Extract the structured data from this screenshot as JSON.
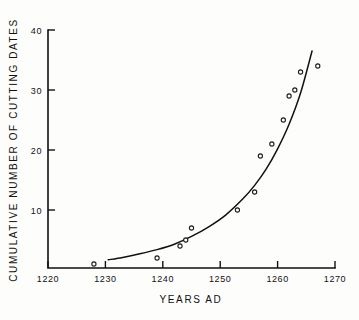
{
  "chart_data": {
    "type": "scatter",
    "title": "",
    "xlabel": "YEARS AD",
    "ylabel": "CUMULATIVE NUMBER OF CUTTING DATES",
    "xlim": [
      1220,
      1270
    ],
    "ylim": [
      0,
      41
    ],
    "xticks": [
      1220,
      1230,
      1240,
      1250,
      1260,
      1270
    ],
    "xtick_labels": [
      "1220",
      "1230",
      "1240",
      "1250",
      "1260",
      "1270"
    ],
    "yticks": [
      10,
      20,
      30,
      40
    ],
    "ytick_labels": [
      "10",
      "20",
      "30",
      "40"
    ],
    "grid": false,
    "legend": "none",
    "marker": "open-circle",
    "points": [
      {
        "x": 1228,
        "y": 1
      },
      {
        "x": 1239,
        "y": 2
      },
      {
        "x": 1243,
        "y": 4
      },
      {
        "x": 1244,
        "y": 5
      },
      {
        "x": 1245,
        "y": 7
      },
      {
        "x": 1253,
        "y": 10
      },
      {
        "x": 1256,
        "y": 13
      },
      {
        "x": 1257,
        "y": 19
      },
      {
        "x": 1259,
        "y": 21
      },
      {
        "x": 1261,
        "y": 25
      },
      {
        "x": 1262,
        "y": 29
      },
      {
        "x": 1263,
        "y": 30
      },
      {
        "x": 1264,
        "y": 33
      },
      {
        "x": 1267,
        "y": 34
      }
    ],
    "fit_curve": {
      "name": "fitted exponential growth curve",
      "x_start": 1230.5,
      "x_end": 1266,
      "y_start": 1.7,
      "y_end": 36.5,
      "samples": [
        {
          "x": 1230.5,
          "y": 1.7
        },
        {
          "x": 1233,
          "y": 2.1
        },
        {
          "x": 1236,
          "y": 2.7
        },
        {
          "x": 1239,
          "y": 3.4
        },
        {
          "x": 1242,
          "y": 4.3
        },
        {
          "x": 1245,
          "y": 5.6
        },
        {
          "x": 1248,
          "y": 7.2
        },
        {
          "x": 1251,
          "y": 9.2
        },
        {
          "x": 1254,
          "y": 11.9
        },
        {
          "x": 1256,
          "y": 14.1
        },
        {
          "x": 1258,
          "y": 16.8
        },
        {
          "x": 1260,
          "y": 20.2
        },
        {
          "x": 1262,
          "y": 24.3
        },
        {
          "x": 1264,
          "y": 29.5
        },
        {
          "x": 1266,
          "y": 36.5
        }
      ]
    }
  }
}
